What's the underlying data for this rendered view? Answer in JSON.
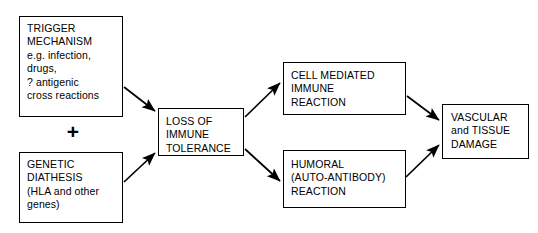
{
  "diagram": {
    "background_color": "#ffffff",
    "line_color": "#000000",
    "text_color": "#000000",
    "connector_symbol": "+",
    "nodes": [
      {
        "id": "trigger",
        "label": "TRIGGER\nMECHANISM\ne.g. infection,\ndrugs,\n? antigenic\ncross reactions"
      },
      {
        "id": "genetic",
        "label": "GENETIC\nDIATHESIS\n(HLA and other\ngenes)"
      },
      {
        "id": "loss",
        "label": "LOSS OF\nIMMUNE\nTOLERANCE"
      },
      {
        "id": "cell",
        "label": "CELL MEDIATED\nIMMUNE\nREACTION"
      },
      {
        "id": "humoral",
        "label": "HUMORAL\n(AUTO-ANTIBODY)\nREACTION"
      },
      {
        "id": "vascular",
        "label": "VASCULAR\nand TISSUE\nDAMAGE"
      }
    ],
    "edges": [
      {
        "id": "trigger-to-loss",
        "from": "trigger",
        "to": "loss"
      },
      {
        "id": "genetic-to-loss",
        "from": "genetic",
        "to": "loss"
      },
      {
        "id": "loss-to-cell",
        "from": "loss",
        "to": "cell"
      },
      {
        "id": "loss-to-humoral",
        "from": "loss",
        "to": "humoral"
      },
      {
        "id": "cell-to-vascular",
        "from": "cell",
        "to": "vascular"
      },
      {
        "id": "humoral-to-vascular",
        "from": "humoral",
        "to": "vascular"
      }
    ]
  }
}
